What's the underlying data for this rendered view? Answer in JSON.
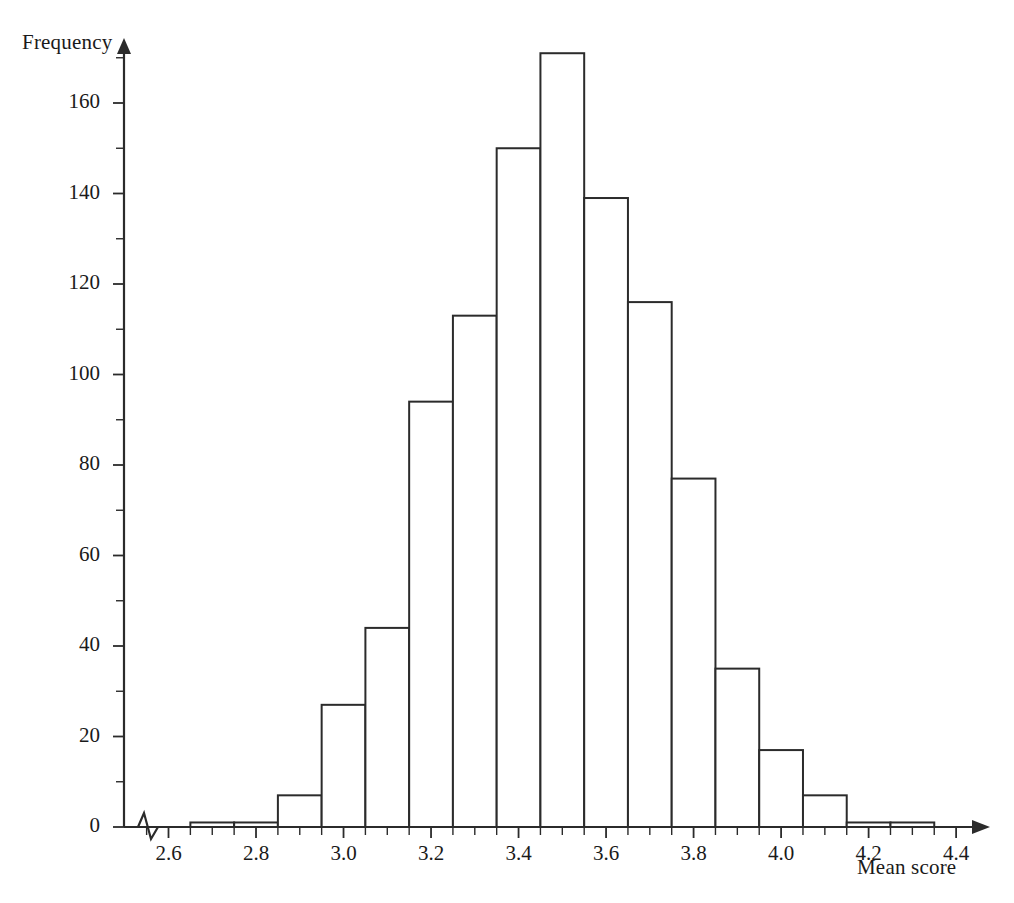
{
  "chart_data": {
    "type": "bar",
    "title": "",
    "subtitle": "",
    "xlabel": "Mean score",
    "ylabel": "Frequency",
    "grid": false,
    "legend": false,
    "legend_position": "none",
    "axis_break_x": true,
    "bin_width": 0.1,
    "xlim": [
      2.55,
      4.45
    ],
    "ylim": [
      0,
      176
    ],
    "xticks": [
      2.6,
      2.8,
      3.0,
      3.2,
      3.4,
      3.6,
      3.8,
      4.0,
      4.2,
      4.4
    ],
    "xtick_labels": [
      "2.6",
      "2.8",
      "3.0",
      "3.2",
      "3.4",
      "3.6",
      "3.8",
      "4.0",
      "4.2",
      "4.4"
    ],
    "xminor_step": 0.05,
    "yticks": [
      0,
      20,
      40,
      60,
      80,
      100,
      120,
      140,
      160
    ],
    "ytick_labels": [
      "0",
      "20",
      "40",
      "60",
      "80",
      "100",
      "120",
      "140",
      "160"
    ],
    "yminor_step": 10,
    "bin_edges": [
      2.65,
      2.75,
      2.85,
      2.95,
      3.05,
      3.15,
      3.25,
      3.35,
      3.45,
      3.55,
      3.65,
      3.75,
      3.85,
      3.95,
      4.05,
      4.15,
      4.25,
      4.35
    ],
    "categories": [
      "2.65-2.75",
      "2.75-2.85",
      "2.85-2.95",
      "2.95-3.05",
      "3.05-3.15",
      "3.15-3.25",
      "3.25-3.35",
      "3.35-3.45",
      "3.45-3.55",
      "3.55-3.65",
      "3.65-3.75",
      "3.75-3.85",
      "3.85-3.95",
      "3.95-4.05",
      "4.05-4.15",
      "4.15-4.25",
      "4.25-4.35"
    ],
    "values": [
      1,
      1,
      7,
      27,
      44,
      94,
      113,
      150,
      171,
      139,
      116,
      77,
      35,
      17,
      7,
      1,
      1
    ],
    "bar_fill": "#ffffff",
    "bar_stroke": "#2b2b2b",
    "axis_color": "#2b2b2b"
  }
}
